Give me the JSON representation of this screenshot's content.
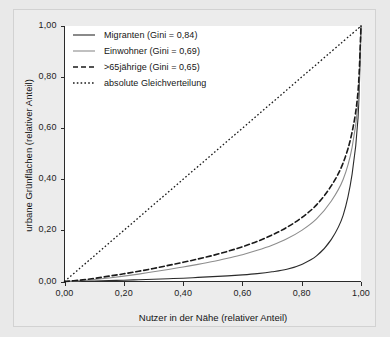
{
  "chart_data": {
    "type": "line",
    "title": "",
    "xlabel": "Nutzer in der Nähe (relativer Anteil)",
    "ylabel": "urbane Grünflächen (relativer Anteil)",
    "xlim": [
      0,
      1
    ],
    "ylim": [
      0,
      1
    ],
    "grid": false,
    "legend_position": "top-left",
    "xticks": [
      "0,00",
      "0,20",
      "0,40",
      "0,60",
      "0,80",
      "1,00"
    ],
    "xtick_values": [
      0,
      0.2,
      0.4,
      0.6,
      0.8,
      1.0
    ],
    "yticks": [
      "0,00",
      "0,20",
      "0,40",
      "0,60",
      "0,80",
      "1,00"
    ],
    "ytick_values": [
      0,
      0.2,
      0.4,
      0.6,
      0.8,
      1.0
    ],
    "x": [
      0,
      0.05,
      0.1,
      0.15,
      0.2,
      0.25,
      0.3,
      0.35,
      0.4,
      0.45,
      0.5,
      0.55,
      0.6,
      0.65,
      0.7,
      0.75,
      0.8,
      0.85,
      0.9,
      0.94,
      0.97,
      0.99,
      1.0
    ],
    "series": [
      {
        "name": "Migranten (Gini = 0,84)",
        "label": "Migranten",
        "gini": "0,84",
        "style": "solid",
        "color": "#2b2b2b",
        "width": 1.1,
        "values": [
          0,
          0.001,
          0.002,
          0.004,
          0.005,
          0.007,
          0.009,
          0.011,
          0.013,
          0.016,
          0.019,
          0.022,
          0.026,
          0.031,
          0.038,
          0.048,
          0.067,
          0.1,
          0.165,
          0.26,
          0.42,
          0.64,
          1.0
        ]
      },
      {
        "name": "Einwohner (Gini = 0,69)",
        "label": "Einwohner",
        "gini": "0,69",
        "style": "solid",
        "color": "#8d8d8d",
        "width": 1.1,
        "values": [
          0,
          0.003,
          0.008,
          0.014,
          0.021,
          0.029,
          0.038,
          0.047,
          0.057,
          0.067,
          0.078,
          0.091,
          0.105,
          0.122,
          0.142,
          0.167,
          0.2,
          0.245,
          0.315,
          0.4,
          0.525,
          0.7,
          1.0
        ]
      },
      {
        "name": ">65jährige (Gini = 0,65)",
        "label": ">65jährige",
        "gini": "0,65",
        "style": "dashed",
        "color": "#1a1a1a",
        "width": 1.6,
        "values": [
          0,
          0.005,
          0.012,
          0.021,
          0.03,
          0.04,
          0.051,
          0.063,
          0.075,
          0.088,
          0.102,
          0.118,
          0.136,
          0.157,
          0.182,
          0.212,
          0.25,
          0.3,
          0.375,
          0.465,
          0.585,
          0.745,
          1.0
        ]
      },
      {
        "name": "absolute Gleichverteilung",
        "label": "absolute Gleichverteilung",
        "gini": "",
        "style": "dotted",
        "color": "#1a1a1a",
        "width": 1.3,
        "values": [
          0,
          0.05,
          0.1,
          0.15,
          0.2,
          0.25,
          0.3,
          0.35,
          0.4,
          0.45,
          0.5,
          0.55,
          0.6,
          0.65,
          0.7,
          0.75,
          0.8,
          0.85,
          0.9,
          0.94,
          0.97,
          0.99,
          1.0
        ]
      }
    ]
  },
  "legend": {
    "items": [
      {
        "text": "Migranten (Gini = 0,84)",
        "swatch": "solid-black"
      },
      {
        "text": "Einwohner (Gini = 0,69)",
        "swatch": "solid-gray"
      },
      {
        "text": ">65jährige (Gini = 0,65)",
        "swatch": "dashed-black"
      },
      {
        "text": "absolute Gleichverteilung",
        "swatch": "dotted-black"
      }
    ]
  },
  "colors": {
    "background": "#e9e9e9",
    "plate": "#ececec",
    "plot_background": "#ffffff",
    "axis": "#2a2a2a",
    "text": "#151515",
    "series_black": "#2b2b2b",
    "series_gray": "#8d8d8d"
  }
}
